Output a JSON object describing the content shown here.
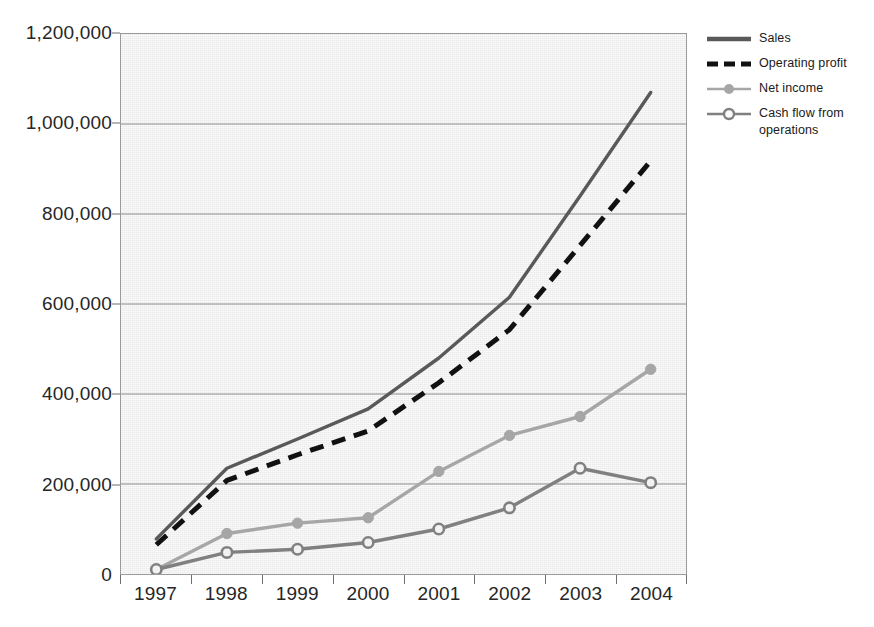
{
  "chart_data": {
    "type": "line",
    "title": "",
    "xlabel": "",
    "ylabel": "",
    "categories": [
      "1997",
      "1998",
      "1999",
      "2000",
      "2001",
      "2002",
      "2003",
      "2004"
    ],
    "ylim": [
      0,
      1200000
    ],
    "ytick_step": 200000,
    "ytick_labels": [
      "0",
      "200,000",
      "400,000",
      "600,000",
      "800,000",
      "1,000,000",
      "1,200,000"
    ],
    "ytick_values": [
      0,
      200000,
      400000,
      600000,
      800000,
      1000000,
      1200000
    ],
    "grid": true,
    "grid_axis": "y",
    "legend_position": "right",
    "series": [
      {
        "name": "Sales",
        "color": "#595959",
        "style": "solid",
        "marker": "none",
        "values": [
          78000,
          235000,
          300000,
          367000,
          480000,
          615000,
          840000,
          1070000
        ]
      },
      {
        "name": "Operating profit",
        "color": "#111111",
        "style": "dashed",
        "marker": "none",
        "values": [
          65000,
          208000,
          265000,
          318000,
          425000,
          543000,
          730000,
          918000
        ]
      },
      {
        "name": "Net income",
        "color": "#a6a6a6",
        "style": "solid",
        "marker": "filled-circle",
        "values": [
          10000,
          90000,
          113000,
          125000,
          228000,
          308000,
          350000,
          455000
        ]
      },
      {
        "name": "Cash flow from operations",
        "color": "#808080",
        "style": "solid",
        "marker": "open-circle",
        "values": [
          10000,
          48000,
          55000,
          70000,
          100000,
          147000,
          235000,
          203000
        ]
      }
    ]
  },
  "legend": {
    "entries": [
      {
        "label": "Sales"
      },
      {
        "label": "Operating profit"
      },
      {
        "label": "Net income"
      },
      {
        "label": "Cash flow from operations"
      }
    ]
  },
  "colors": {
    "plot_background": "#ebebeb",
    "plot_border": "#9a9a9a",
    "gridline": "#8c8c8c",
    "axis_text": "#262626",
    "legend_text": "#1a1a1a"
  }
}
